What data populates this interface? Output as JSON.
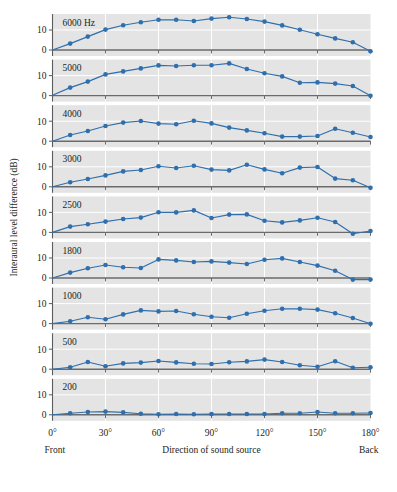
{
  "figure": {
    "background": "#ffffff",
    "panel_background": "#e4e4e4",
    "gridline_color": "#ffffff",
    "series_color": "#2f6fad",
    "marker_color": "#2f6fad",
    "axis_color": "#5c5c5c",
    "text_color": "#231f20"
  },
  "chart_data": {
    "type": "line",
    "title": "",
    "xlabel": "Direction of sound source",
    "ylabel": "Interaural level difference (dB)",
    "xlim": [
      0,
      180
    ],
    "ylim": [
      -3,
      18
    ],
    "xticks": [
      0,
      30,
      60,
      90,
      120,
      150,
      180
    ],
    "xticklabels": [
      "0°",
      "30°",
      "60°",
      "90°",
      "120°",
      "150°",
      "180°"
    ],
    "yticks": [
      0,
      10
    ],
    "yticklabels": [
      "0",
      "10"
    ],
    "grid": true,
    "legend": "none",
    "x_end_labels": {
      "left": "Front",
      "right": "Back"
    },
    "x": [
      0,
      10,
      20,
      30,
      40,
      50,
      60,
      70,
      80,
      90,
      100,
      110,
      120,
      130,
      140,
      150,
      160,
      170,
      180
    ],
    "series": [
      {
        "name": "6000 Hz",
        "label": "6000 Hz",
        "values": [
          0,
          3.2,
          6.7,
          10.2,
          12.4,
          13.9,
          15.1,
          15.1,
          14.5,
          15.7,
          16.4,
          15.5,
          14.2,
          12.3,
          10.1,
          7.9,
          5.8,
          3.9,
          -0.6
        ]
      },
      {
        "name": "5000",
        "label": "5000",
        "values": [
          0.2,
          4.0,
          7.0,
          10.6,
          12.1,
          13.6,
          15.1,
          14.8,
          15.2,
          15.2,
          16.1,
          13.3,
          11.2,
          9.6,
          6.4,
          6.6,
          6.0,
          4.8,
          -0.1
        ]
      },
      {
        "name": "4000",
        "label": "4000",
        "values": [
          0,
          3.1,
          5.1,
          7.6,
          9.3,
          10.1,
          8.8,
          8.5,
          10.2,
          8.9,
          6.8,
          5.4,
          4.0,
          2.3,
          2.3,
          2.6,
          6.2,
          4.2,
          2.1
        ]
      },
      {
        "name": "3000",
        "label": "3000",
        "values": [
          0,
          2.3,
          3.9,
          5.7,
          7.7,
          8.4,
          10.3,
          9.4,
          10.5,
          8.6,
          8.2,
          11.0,
          8.7,
          6.8,
          9.6,
          9.9,
          4.1,
          3.3,
          -0.5
        ]
      },
      {
        "name": "2500",
        "label": "2500",
        "values": [
          0,
          2.9,
          4.1,
          5.4,
          6.7,
          7.4,
          10.1,
          10.0,
          11.0,
          7.2,
          8.9,
          9.0,
          5.8,
          5.0,
          6.0,
          7.3,
          5.2,
          -0.7,
          0.7
        ]
      },
      {
        "name": "1800",
        "label": "1800",
        "values": [
          0,
          2.7,
          4.9,
          6.5,
          5.4,
          5.0,
          9.3,
          8.8,
          8.0,
          8.3,
          7.7,
          7.0,
          9.1,
          9.8,
          8.0,
          6.2,
          3.6,
          -0.8,
          -0.8
        ]
      },
      {
        "name": "1000",
        "label": "1000",
        "values": [
          0,
          1.2,
          3.2,
          2.2,
          4.6,
          6.6,
          6.1,
          6.3,
          4.7,
          3.4,
          2.9,
          4.9,
          6.4,
          7.4,
          7.4,
          7.0,
          5.2,
          2.8,
          -0.1
        ]
      },
      {
        "name": "500",
        "label": "500",
        "values": [
          0,
          1.0,
          3.6,
          1.5,
          2.9,
          3.3,
          4.1,
          3.4,
          2.7,
          2.6,
          3.5,
          3.9,
          4.8,
          3.6,
          2.0,
          1.2,
          4.0,
          0.7,
          1.0
        ]
      },
      {
        "name": "200",
        "label": "200",
        "values": [
          0,
          0.8,
          1.4,
          1.6,
          1.2,
          0.5,
          0.3,
          0.4,
          0.3,
          0.4,
          0.4,
          0.4,
          0.4,
          0.8,
          0.8,
          1.4,
          0.8,
          0.8,
          0.9
        ]
      }
    ]
  }
}
